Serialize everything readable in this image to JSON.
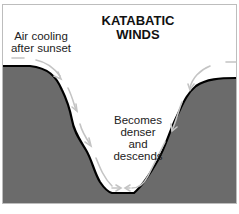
{
  "diagram": {
    "title_line1": "KATABATIC",
    "title_line2": "WINDS",
    "label_left_line1": "Air cooling",
    "label_left_line2": "after sunset",
    "label_center_line1": "Becomes",
    "label_center_line2": "denser",
    "label_center_line3": "and",
    "label_center_line4": "descends",
    "colors": {
      "terrain": "#6b6b6b",
      "terrain_outline": "#000000",
      "arrows": "#c8c8c8",
      "background": "#ffffff"
    }
  }
}
